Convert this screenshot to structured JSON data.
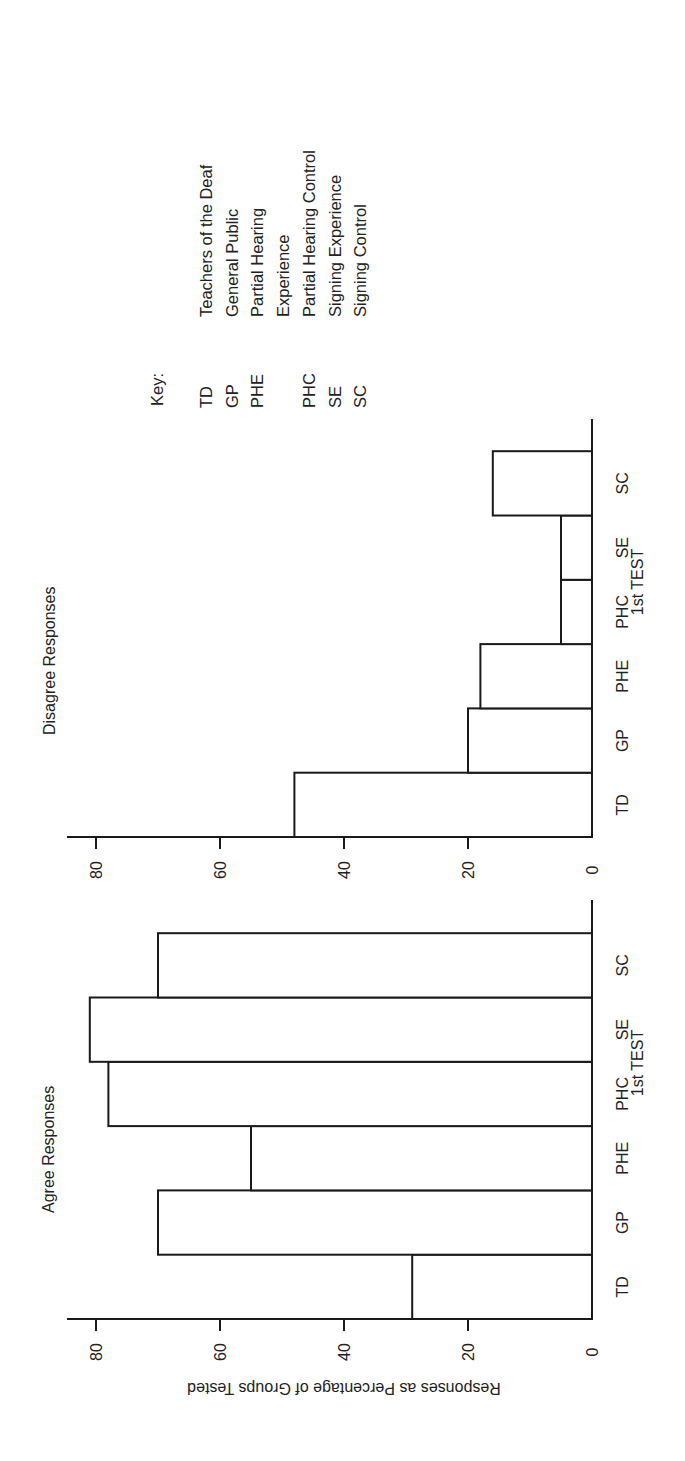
{
  "figure": {
    "orientation": "rotated-90-ccw",
    "axis_title": "Responses as Percentage of Groups Tested",
    "category_axis_title": "1st TEST",
    "colors": {
      "ink": "#1a1a1a",
      "background": "#ffffff",
      "bar_fill": "#ffffff"
    }
  },
  "key": {
    "heading": "Key:",
    "items": [
      {
        "abbr": "TD",
        "label": "Teachers of the Deaf"
      },
      {
        "abbr": "GP",
        "label": "General Public"
      },
      {
        "abbr": "PHE",
        "label": "Partial Hearing"
      },
      {
        "abbr": "",
        "label": "Experience"
      },
      {
        "abbr": "PHC",
        "label": "Partial Hearing Control"
      },
      {
        "abbr": "SE",
        "label": "Signing Experience"
      },
      {
        "abbr": "SC",
        "label": "Signing Control"
      }
    ]
  },
  "chart_data": [
    {
      "type": "bar",
      "title": "Disagree Responses",
      "categories": [
        "TD",
        "GP",
        "PHE",
        "PHC",
        "SE",
        "SC"
      ],
      "values": [
        48,
        20,
        18,
        5,
        5,
        16
      ],
      "xlabel": "1st TEST",
      "ylabel": "Responses as Percentage of Groups Tested",
      "yticks": [
        0,
        20,
        40,
        60,
        80
      ],
      "ylim": [
        0,
        85
      ],
      "grid": false,
      "legend": "none (Key lists group abbreviations)"
    },
    {
      "type": "bar",
      "title": "Agree Responses",
      "categories": [
        "TD",
        "GP",
        "PHE",
        "PHC",
        "SE",
        "SC"
      ],
      "values": [
        29,
        70,
        55,
        78,
        81,
        70
      ],
      "xlabel": "1st TEST",
      "ylabel": "Responses as Percentage of Groups Tested",
      "yticks": [
        0,
        20,
        40,
        60,
        80
      ],
      "ylim": [
        0,
        85
      ],
      "grid": false,
      "legend": "none (Key lists group abbreviations)"
    }
  ]
}
